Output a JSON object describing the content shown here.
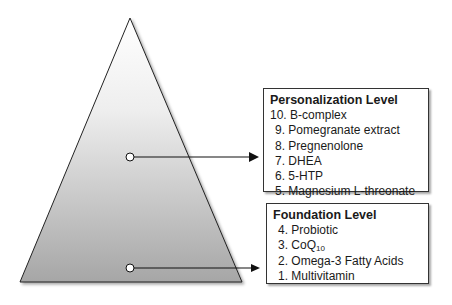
{
  "diagram": {
    "shape": "pyramid",
    "colors": {
      "fill_top": "#ffffff",
      "fill_bottom": "#a8a8a8",
      "stroke": "#222222"
    }
  },
  "personalization": {
    "title": "Personalization Level",
    "items": [
      {
        "num": "10.",
        "text": "B-complex"
      },
      {
        "num": "9.",
        "text": "Pomegranate extract"
      },
      {
        "num": "8.",
        "text": "Pregnenolone"
      },
      {
        "num": "7.",
        "text": "DHEA"
      },
      {
        "num": "6.",
        "text": "5-HTP"
      },
      {
        "num": "5.",
        "text": "Magnesium L-threonate"
      }
    ]
  },
  "foundation": {
    "title": "Foundation Level",
    "items": [
      {
        "num": "4.",
        "text": "Probiotic"
      },
      {
        "num": "3.",
        "text": "CoQ",
        "sub": "10"
      },
      {
        "num": "2.",
        "text": "Omega-3 Fatty Acids"
      },
      {
        "num": "1.",
        "text": "Multivitamin"
      }
    ]
  }
}
